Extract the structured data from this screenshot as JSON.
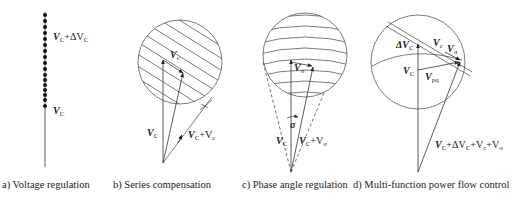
{
  "figure": {
    "panels": [
      {
        "id": "a",
        "caption": "a) Voltage regulation",
        "labels": {
          "top": "V",
          "top_sub": "C",
          "top_plus": "+ΔV",
          "top_plus_sub": "C",
          "bottom": "V",
          "bottom_sub": "C"
        }
      },
      {
        "id": "b",
        "caption": "b) Series compensation",
        "labels": {
          "vc_small": "V",
          "vc_small_sub": "c",
          "vC": "V",
          "vC_sub": "C",
          "sum": "V",
          "sum_sub": "C",
          "sum_plus": "+V",
          "sum_plus_sub": "c"
        }
      },
      {
        "id": "c",
        "caption": "c) Phase angle regulation",
        "labels": {
          "vsigma": "V",
          "vsigma_sub": "σ",
          "sigma": "σ",
          "vC": "V",
          "vC_sub": "C",
          "sum": "V",
          "sum_sub": "C",
          "sum_plus": "+V",
          "sum_plus_sub": "σ"
        }
      },
      {
        "id": "d",
        "caption": "d) Multi-function power flow control",
        "labels": {
          "dvc": "ΔV",
          "dvc_sub": "C",
          "vc": "V",
          "vc_sub": "c",
          "vsigma": "V",
          "vsigma_sub": "σ",
          "vC": "V",
          "vC_sub": "C",
          "vpq": "V",
          "vpq_sub": "pq",
          "sum": "V",
          "sum_sub": "C",
          "sum_rest": "+ΔV",
          "sum_rest_sub": "C",
          "sum_rest2": "+V",
          "sum_rest2_sub": "c",
          "sum_rest3": "+V",
          "sum_rest3_sub": "σ"
        }
      }
    ]
  }
}
